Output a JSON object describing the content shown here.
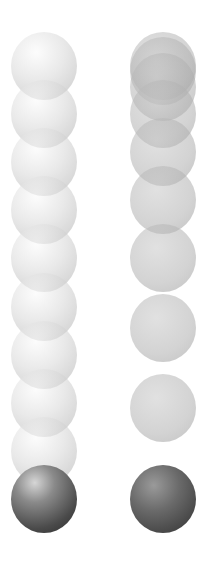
{
  "diagram": {
    "sphere_count_per_column": 10,
    "sphere_size": {
      "width": 66,
      "height": 68
    },
    "columns": [
      {
        "name": "uniform-motion",
        "center_x": 44,
        "style_ghost": "light",
        "style_final": "shaded",
        "center_y": [
          66,
          114,
          162,
          210,
          258,
          307,
          355,
          403,
          451,
          499
        ]
      },
      {
        "name": "accelerated-motion",
        "center_x": 163,
        "style_ghost": "flat",
        "style_final": "dark",
        "center_y": [
          66,
          71,
          87,
          114,
          152,
          200,
          258,
          328,
          408,
          499
        ]
      }
    ],
    "colors": {
      "background": "#ffffff",
      "ghost_light": "#d7d7d7",
      "ghost_flat": "#afafaf",
      "final_shaded": "#4a4a4a",
      "final_dark": "#444444"
    }
  }
}
